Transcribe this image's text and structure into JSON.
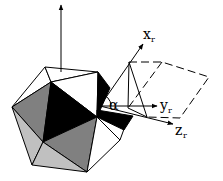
{
  "diagram": {
    "type": "3d-geometry",
    "labels": {
      "alpha": "α",
      "x_axis": "x",
      "x_sub": "r",
      "y_axis": "y",
      "y_sub": "r",
      "z_axis": "z",
      "z_sub": "r"
    },
    "colors": {
      "background": "#ffffff",
      "stroke": "#000000",
      "face_black": "#000000",
      "face_dark_gray": "#808080",
      "face_light_gray": "#c0c0c0",
      "face_white": "#ffffff"
    }
  }
}
